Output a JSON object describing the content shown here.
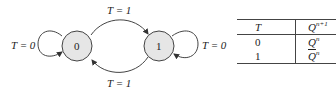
{
  "diagram": {
    "type": "state-transition",
    "states": [
      {
        "id": "s0",
        "label": "0"
      },
      {
        "id": "s1",
        "label": "1"
      }
    ],
    "transitions": [
      {
        "from": "0",
        "to": "0",
        "label": "T = 0"
      },
      {
        "from": "0",
        "to": "1",
        "label": "T = 1"
      },
      {
        "from": "1",
        "to": "0",
        "label": "T = 1"
      },
      {
        "from": "1",
        "to": "1",
        "label": "T = 0"
      }
    ]
  },
  "table": {
    "headers": {
      "t": "T",
      "q_base": "Q",
      "q_sup": "n+1"
    },
    "rows": [
      {
        "t": "0",
        "q_base": "Q",
        "q_sup": "n",
        "complement": false
      },
      {
        "t": "1",
        "q_base": "Q",
        "q_sup": "n",
        "complement": true
      }
    ]
  },
  "colors": {
    "state_fill": "#e6e6e6",
    "stroke": "#444444"
  }
}
